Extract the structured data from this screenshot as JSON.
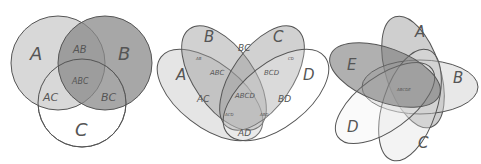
{
  "diagrams": [
    {
      "name": "three-set-venn",
      "sets": [
        "A",
        "B",
        "C"
      ],
      "regions": [
        "AB",
        "ABC",
        "AC",
        "BC"
      ]
    },
    {
      "name": "four-set-venn",
      "sets": [
        "A",
        "B",
        "C",
        "D"
      ],
      "regions": [
        "BC",
        "AB",
        "CD",
        "ABC",
        "BCD",
        "AC",
        "ABCD",
        "BD",
        "ACD",
        "ABD",
        "AD"
      ]
    },
    {
      "name": "five-set-venn",
      "sets": [
        "A",
        "B",
        "C",
        "D",
        "E"
      ],
      "regions": [
        "ABCDE"
      ]
    }
  ],
  "colors": {
    "stroke": "#555555",
    "light": "#d9d9d9",
    "mid": "#a8a8a8",
    "dark": "#777777"
  }
}
